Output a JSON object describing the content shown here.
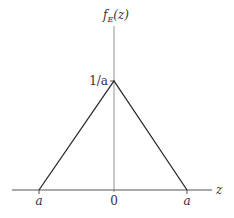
{
  "figure": {
    "y_axis_label": {
      "func": "f",
      "subscript": "E",
      "arg": "(z)"
    },
    "x_axis_label": "z",
    "peak_label": "1/a",
    "x_ticks": [
      {
        "label": "a",
        "position": "left"
      },
      {
        "label": "0",
        "position": "center"
      },
      {
        "label": "a",
        "position": "right"
      }
    ]
  },
  "shape": {
    "type": "triangle",
    "description": "Triangular probability density function",
    "points": [
      {
        "z": "-a",
        "f": "0"
      },
      {
        "z": "0",
        "f": "1/a"
      },
      {
        "z": "a",
        "f": "0"
      }
    ]
  },
  "colors": {
    "line": "#2a2a2a",
    "axis": "#555555",
    "text": "#333333",
    "background": "#ffffff"
  }
}
